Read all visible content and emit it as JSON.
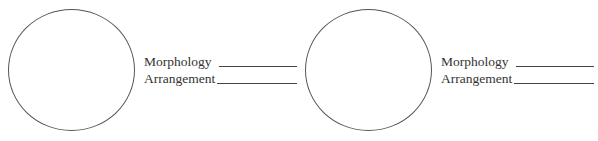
{
  "panels": [
    {
      "fields": [
        {
          "label": "Morphology",
          "value": ""
        },
        {
          "label": "Arrangement",
          "value": ""
        }
      ]
    },
    {
      "fields": [
        {
          "label": "Morphology",
          "value": ""
        },
        {
          "label": "Arrangement",
          "value": ""
        }
      ]
    }
  ]
}
